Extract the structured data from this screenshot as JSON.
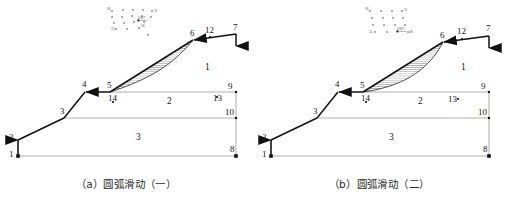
{
  "figure": {
    "panel_count": 2
  },
  "panels": [
    {
      "id": "a",
      "caption": "（a）圆弧滑动（一）",
      "caption_prefix": "（a）",
      "caption_text": "圆弧滑动（一）",
      "node_labels": [
        "1",
        "2",
        "3",
        "4",
        "5",
        "6",
        "7",
        "8",
        "9",
        "10",
        "12",
        "13",
        "14"
      ],
      "zone_labels": [
        "1",
        "2",
        "3"
      ],
      "cluster_labels": [
        "16",
        "11",
        "15",
        "18"
      ],
      "scale_label": "0.007",
      "slip_surface": "circular-arc-deep"
    },
    {
      "id": "b",
      "caption": "（b）圆弧滑动（二）",
      "caption_prefix": "（b）",
      "caption_text": "圆弧滑动（二）",
      "node_labels": [
        "1",
        "2",
        "3",
        "4",
        "5",
        "6",
        "7",
        "8",
        "9",
        "10",
        "12",
        "13",
        "14"
      ],
      "zone_labels": [
        "1",
        "2",
        "3"
      ],
      "cluster_labels": [
        "16",
        "11",
        "15",
        "18"
      ],
      "scale_label": "0.007",
      "slip_surface": "circular-arc-shallow"
    }
  ],
  "nodes": {
    "n1": "1",
    "n2": "2",
    "n3": "3",
    "n4": "4",
    "n5": "5",
    "n6": "6",
    "n7": "7",
    "n8": "8",
    "n9": "9",
    "n10": "10",
    "n11": "11",
    "n12": "12",
    "n13": "13",
    "n14": "14",
    "n15": "15",
    "n16": "16",
    "n18": "18"
  },
  "zones": {
    "zone1": "1",
    "zone2": "2",
    "zone3": "3"
  },
  "colors": {
    "background": "#ffffff",
    "bold_stroke": "#111111",
    "thin_stroke": "#8e8e8e",
    "hatch_stroke": "#2a2a2a",
    "text": "#151515",
    "caption_text": "#2b2b2b"
  }
}
